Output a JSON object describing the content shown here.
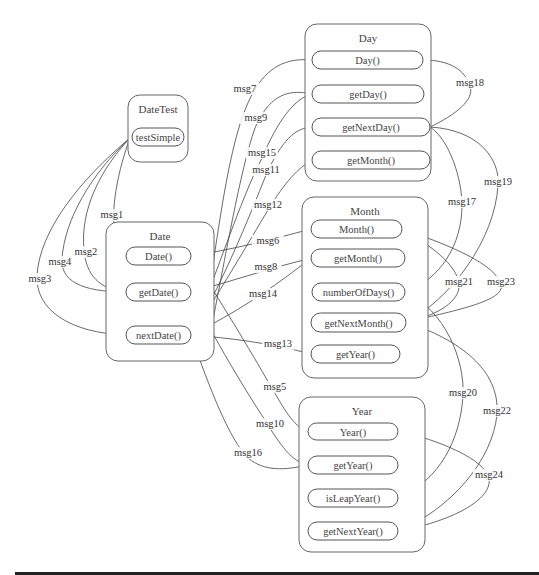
{
  "diagram": {
    "classes": [
      {
        "id": "DateTest",
        "title": "DateTest",
        "x": 128,
        "y": 95,
        "w": 60,
        "h": 67,
        "methods": [
          {
            "id": "testSimple",
            "label": "testSimple",
            "x": 132,
            "y": 128,
            "w": 52,
            "h": 18
          }
        ]
      },
      {
        "id": "Date",
        "title": "Date",
        "x": 106,
        "y": 222,
        "w": 108,
        "h": 139,
        "methods": [
          {
            "id": "Date",
            "label": "Date()",
            "x": 126,
            "y": 247,
            "w": 65,
            "h": 18
          },
          {
            "id": "getDate",
            "label": "getDate()",
            "x": 126,
            "y": 283,
            "w": 65,
            "h": 18
          },
          {
            "id": "nextDate",
            "label": "nextDate()",
            "x": 126,
            "y": 326,
            "w": 65,
            "h": 18
          }
        ]
      },
      {
        "id": "Day",
        "title": "Day",
        "x": 305,
        "y": 24,
        "w": 126,
        "h": 157,
        "methods": [
          {
            "id": "Day",
            "label": "Day()",
            "x": 312,
            "y": 51,
            "w": 111,
            "h": 18
          },
          {
            "id": "getDay",
            "label": "getDay()",
            "x": 312,
            "y": 85,
            "w": 112,
            "h": 18
          },
          {
            "id": "getNextDay",
            "label": "getNextDay()",
            "x": 312,
            "y": 118,
            "w": 118,
            "h": 18
          },
          {
            "id": "getMonthDay",
            "label": "getMonth()",
            "x": 312,
            "y": 151,
            "w": 118,
            "h": 18
          }
        ]
      },
      {
        "id": "Month",
        "title": "Month",
        "x": 302,
        "y": 197,
        "w": 126,
        "h": 181,
        "methods": [
          {
            "id": "Month",
            "label": "Month()",
            "x": 311,
            "y": 220,
            "w": 91,
            "h": 18
          },
          {
            "id": "getMonth",
            "label": "getMonth()",
            "x": 311,
            "y": 249,
            "w": 94,
            "h": 18
          },
          {
            "id": "numberOfDays",
            "label": "numberOfDays()",
            "x": 312,
            "y": 283,
            "w": 93,
            "h": 18
          },
          {
            "id": "getNextMonth",
            "label": "getNextMonth()",
            "x": 311,
            "y": 313,
            "w": 95,
            "h": 19
          },
          {
            "id": "getYearMonth",
            "label": "getYear()",
            "x": 311,
            "y": 345,
            "w": 89,
            "h": 18
          }
        ]
      },
      {
        "id": "Year",
        "title": "Year",
        "x": 299,
        "y": 397,
        "w": 126,
        "h": 155,
        "methods": [
          {
            "id": "Year",
            "label": "Year()",
            "x": 308,
            "y": 423,
            "w": 90,
            "h": 17
          },
          {
            "id": "getYear",
            "label": "getYear()",
            "x": 308,
            "y": 456,
            "w": 90,
            "h": 18
          },
          {
            "id": "isLeapYear",
            "label": "isLeapYear()",
            "x": 308,
            "y": 489,
            "w": 90,
            "h": 18
          },
          {
            "id": "getNextYear",
            "label": "getNextYear()",
            "x": 308,
            "y": 522,
            "w": 90,
            "h": 18
          }
        ]
      }
    ],
    "messages": [
      {
        "label": "msg1",
        "lx": 112,
        "ly": 218,
        "d": "M130,138 C118,170 112,205 114,225 C116,240 120,252 126,256"
      },
      {
        "label": "msg2",
        "lx": 86,
        "ly": 255,
        "d": "M130,138 C100,170 80,210 84,250 C86,275 100,290 126,292"
      },
      {
        "label": "msg4",
        "lx": 60,
        "ly": 265,
        "d": "M130,138 C90,175 65,220 62,258 C60,280 80,292 126,292"
      },
      {
        "label": "msg3",
        "lx": 40,
        "ly": 282,
        "d": "M130,138 C80,180 40,230 37,275 C35,310 70,333 126,335"
      },
      {
        "label": "msg7",
        "lx": 245,
        "ly": 92,
        "d": "M202,335 C215,260 225,160 245,110 C260,72 280,57 312,60"
      },
      {
        "label": "msg9",
        "lx": 256,
        "ly": 121,
        "d": "M210,335 C225,260 240,170 255,128 C268,98 285,88 312,94"
      },
      {
        "label": "msg15",
        "lx": 262,
        "ly": 156,
        "d": "M191,335 C215,280 240,200 262,158 C278,120 295,98 312,94"
      },
      {
        "label": "msg11",
        "lx": 266,
        "ly": 173,
        "d": "M191,335 C220,290 250,215 266,175 C282,140 295,128 312,127"
      },
      {
        "label": "msg12",
        "lx": 268,
        "ly": 208,
        "d": "M191,335 C215,300 250,240 268,210 C285,182 298,168 312,160"
      },
      {
        "label": "msg6",
        "lx": 268,
        "ly": 244,
        "d": "M191,256 C230,250 270,240 311,229"
      },
      {
        "label": "msg8",
        "lx": 266,
        "ly": 270,
        "d": "M191,292 C230,282 270,268 311,258"
      },
      {
        "label": "msg14",
        "lx": 263,
        "ly": 297,
        "d": "M191,335 C225,318 260,298 311,258"
      },
      {
        "label": "msg13",
        "lx": 278,
        "ly": 347,
        "d": "M191,335 C230,338 270,343 311,354"
      },
      {
        "label": "msg5",
        "lx": 275,
        "ly": 390,
        "d": "M191,256 C220,300 250,350 270,385 C285,410 292,425 308,432"
      },
      {
        "label": "msg10",
        "lx": 270,
        "ly": 427,
        "d": "M191,292 C215,340 245,390 265,420 C280,445 292,462 308,465"
      },
      {
        "label": "msg16",
        "lx": 248,
        "ly": 456,
        "d": "M191,335 C210,390 230,440 248,458 C265,472 285,470 308,465"
      },
      {
        "label": "msg18",
        "lx": 470,
        "ly": 86,
        "d": "M430,127 C455,115 475,100 470,86 C465,70 450,60 423,60"
      },
      {
        "label": "msg17",
        "lx": 462,
        "ly": 205,
        "d": "M430,127 C450,140 462,180 462,205 C462,245 440,280 405,292"
      },
      {
        "label": "msg19",
        "lx": 498,
        "ly": 185,
        "d": "M430,127 C480,130 500,160 498,185 C495,240 450,300 406,322"
      },
      {
        "label": "msg21",
        "lx": 459,
        "ly": 285,
        "d": "M406,322 C440,315 460,300 459,285 C458,265 430,245 402,229"
      },
      {
        "label": "msg23",
        "lx": 501,
        "ly": 285,
        "d": "M406,322 C460,310 505,300 501,285 C497,265 450,245 402,229"
      },
      {
        "label": "msg20",
        "lx": 463,
        "ly": 396,
        "d": "M405,292 C445,310 465,360 463,396 C460,440 440,480 398,498"
      },
      {
        "label": "msg22",
        "lx": 497,
        "ly": 414,
        "d": "M406,322 C460,340 500,370 497,414 C493,460 450,510 398,531"
      },
      {
        "label": "msg24",
        "lx": 489,
        "ly": 478,
        "d": "M398,431 C440,440 485,460 489,478 C493,500 450,522 398,531"
      }
    ]
  }
}
